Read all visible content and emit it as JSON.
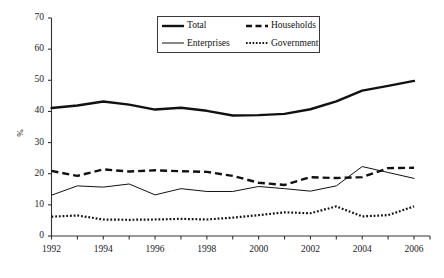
{
  "chart_data": {
    "type": "line",
    "title": "",
    "subtitle": "",
    "xlabel": "",
    "ylabel": "%",
    "xlim": [
      1992,
      2006
    ],
    "ylim": [
      0,
      70
    ],
    "ytick_step": 10,
    "yticks": [
      "0",
      "10",
      "20",
      "30",
      "40",
      "50",
      "60",
      "70"
    ],
    "xticks": [
      "1992",
      "1994",
      "1996",
      "1998",
      "2000",
      "2002",
      "2004",
      "2006"
    ],
    "x": [
      1992,
      1993,
      1994,
      1995,
      1996,
      1997,
      1998,
      1999,
      2000,
      2001,
      2002,
      2003,
      2004,
      2005,
      2006
    ],
    "grid": false,
    "legend_position": "top-center",
    "series": [
      {
        "name": "Total",
        "style": "solid-thick",
        "color": "#111111",
        "values": [
          41.1,
          41.9,
          43.2,
          42.2,
          40.6,
          41.2,
          40.2,
          38.7,
          38.8,
          39.2,
          40.7,
          43.2,
          46.7,
          48.2,
          49.8
        ]
      },
      {
        "name": "Households",
        "style": "dashed-thick",
        "color": "#111111",
        "values": [
          20.9,
          19.3,
          21.4,
          20.7,
          21.1,
          20.8,
          20.6,
          19.3,
          17.1,
          16.4,
          18.9,
          18.6,
          18.9,
          21.8,
          21.9
        ]
      },
      {
        "name": "Enterprises",
        "style": "solid-thin",
        "color": "#111111",
        "values": [
          13.1,
          16.1,
          15.7,
          16.7,
          13.2,
          15.2,
          14.3,
          14.3,
          15.9,
          15.2,
          14.4,
          16.1,
          22.3,
          20.4,
          18.5
        ]
      },
      {
        "name": "Government",
        "style": "dotted",
        "color": "#111111",
        "values": [
          6.2,
          6.6,
          5.3,
          5.2,
          5.3,
          5.5,
          5.3,
          5.9,
          6.7,
          7.6,
          7.3,
          9.5,
          6.3,
          6.7,
          9.5
        ]
      }
    ]
  },
  "legend": {
    "entries": [
      {
        "label": "Total",
        "swatch": "solid-thick-swatch"
      },
      {
        "label": "Households",
        "swatch": "dashed-thick-swatch"
      },
      {
        "label": "Enterprises",
        "swatch": "solid-thin-swatch"
      },
      {
        "label": "Government",
        "swatch": "dotted-swatch"
      }
    ]
  },
  "axis": {
    "y_title": "%"
  },
  "colors": {
    "ink": "#111111",
    "axis": "#333333",
    "background": "#ffffff"
  }
}
